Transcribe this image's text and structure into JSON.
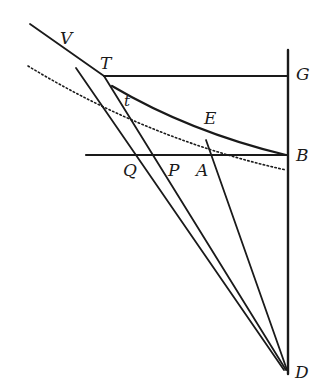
{
  "figure": {
    "type": "geometric-diagram",
    "ink_color": "#1a1a1a",
    "background": "#ffffff",
    "labels": [
      {
        "id": "V",
        "text": "V",
        "x": 60,
        "y": 30
      },
      {
        "id": "T",
        "text": "T",
        "x": 100,
        "y": 55
      },
      {
        "id": "G",
        "text": "G",
        "x": 296,
        "y": 66
      },
      {
        "id": "t",
        "text": "t",
        "x": 124,
        "y": 94
      },
      {
        "id": "E",
        "text": "E",
        "x": 204,
        "y": 110
      },
      {
        "id": "B",
        "text": "B",
        "x": 296,
        "y": 147
      },
      {
        "id": "Q",
        "text": "Q",
        "x": 123,
        "y": 162
      },
      {
        "id": "P",
        "text": "P",
        "x": 168,
        "y": 162
      },
      {
        "id": "A",
        "text": "A",
        "x": 196,
        "y": 162
      },
      {
        "id": "D",
        "text": "D",
        "x": 295,
        "y": 364
      }
    ],
    "points": {
      "V": [
        62,
        50
      ],
      "T": [
        104,
        76
      ],
      "G": [
        288,
        76
      ],
      "t": [
        132,
        110
      ],
      "E": [
        208,
        130
      ],
      "B": [
        288,
        155
      ],
      "Q": [
        138,
        155
      ],
      "P": [
        160,
        155
      ],
      "A": [
        206,
        155
      ],
      "D": [
        288,
        372
      ]
    }
  }
}
